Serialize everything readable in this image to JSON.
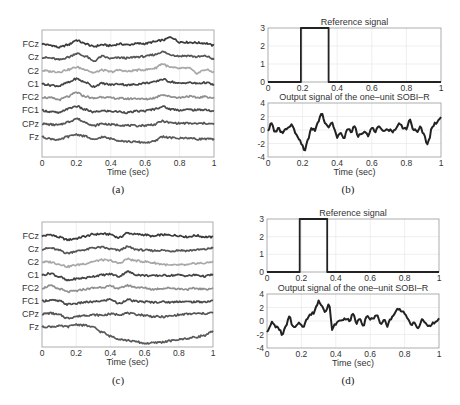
{
  "chart_data": [
    {
      "panel": "(a)",
      "type": "line",
      "title": "",
      "xlabel": "Time (sec)",
      "ylabel": "",
      "xlim": [
        0,
        1
      ],
      "xticks": [
        "0",
        "0.2",
        "0.4",
        "0.6",
        "0.8",
        "1"
      ],
      "grid": true,
      "channels": [
        "FCz",
        "Cz",
        "C2",
        "C1",
        "FC2",
        "FC1",
        "CPz",
        "Fz"
      ],
      "channel_colors": [
        "#3a3a3a",
        "#555555",
        "#a8a8a8",
        "#444444",
        "#909090",
        "#4a4a4a",
        "#555555",
        "#5a5a5a"
      ],
      "x": [
        0,
        0.05,
        0.1,
        0.15,
        0.2,
        0.25,
        0.3,
        0.35,
        0.4,
        0.45,
        0.5,
        0.55,
        0.6,
        0.65,
        0.7,
        0.75,
        0.8,
        0.85,
        0.9,
        0.95,
        1.0
      ],
      "series": [
        {
          "name": "FCz",
          "values": [
            0,
            -0.3,
            -0.8,
            -0.2,
            0.9,
            0.1,
            -0.6,
            -0.2,
            -0.4,
            0,
            -0.2,
            0.1,
            0.1,
            0.5,
            0.9,
            1.6,
            0.5,
            0.4,
            0.3,
            0.2,
            -0.4
          ]
        },
        {
          "name": "Cz",
          "values": [
            0,
            -0.2,
            -0.6,
            0,
            0.9,
            0.3,
            -0.9,
            0.2,
            -0.3,
            -0.1,
            -0.2,
            0.1,
            0.2,
            0.6,
            1.3,
            0.6,
            0.3,
            0.4,
            0.1,
            0.3,
            -0.4
          ]
        },
        {
          "name": "C2",
          "values": [
            0,
            -0.2,
            -0.3,
            0.2,
            0.8,
            0.3,
            -0.5,
            0.1,
            -0.3,
            0.1,
            -0.2,
            0.1,
            0.2,
            0.5,
            1.6,
            0.7,
            0.5,
            0.6,
            -0.6,
            0.2,
            -0.3
          ]
        },
        {
          "name": "C1",
          "values": [
            0,
            -0.3,
            -0.5,
            0.3,
            1.2,
            0.4,
            -0.6,
            0.1,
            -0.2,
            0,
            -0.3,
            -0.1,
            0.2,
            0.4,
            1.1,
            0.5,
            0.1,
            0.3,
            0.1,
            0.3,
            -0.2
          ]
        },
        {
          "name": "FC2",
          "values": [
            0,
            -0.2,
            -0.6,
            0.1,
            1.1,
            0.2,
            -0.3,
            0.1,
            -0.2,
            -0.3,
            -0.4,
            -0.3,
            -0.5,
            -0.2,
            0.6,
            0.1,
            -0.1,
            0.2,
            -0.1,
            0.1,
            -0.2
          ]
        },
        {
          "name": "FC1",
          "values": [
            0,
            -0.3,
            -0.6,
            0.4,
            1.0,
            0.2,
            -0.4,
            -0.1,
            -0.2,
            -0.3,
            -0.5,
            -0.2,
            -0.1,
            0.3,
            0.9,
            0.3,
            0.1,
            0.2,
            0.1,
            0.2,
            -0.3
          ]
        },
        {
          "name": "CPz",
          "values": [
            0,
            -0.2,
            -0.3,
            0.4,
            1.2,
            0.4,
            -0.5,
            0,
            -0.2,
            -0.3,
            -0.4,
            -0.5,
            -0.4,
            -0.2,
            0.6,
            0.2,
            0.1,
            0.1,
            0,
            0.1,
            -0.1
          ]
        },
        {
          "name": "Fz",
          "values": [
            0,
            -0.4,
            -0.7,
            0.1,
            0.6,
            0.2,
            -0.7,
            0,
            -0.4,
            -0.8,
            -1.1,
            -1.2,
            -1.3,
            -1.1,
            0.1,
            -0.2,
            -0.3,
            -0.2,
            -0.5,
            -0.4,
            -0.6
          ]
        }
      ]
    },
    {
      "panel": "(b)",
      "subplots": [
        {
          "type": "line",
          "title": "Reference signal",
          "xlim": [
            0,
            1
          ],
          "ylim": [
            0,
            3
          ],
          "xticks": [
            "0",
            "0.2",
            "0.4",
            "0.6",
            "0.8",
            "1"
          ],
          "yticks": [
            "0",
            "1",
            "2",
            "3"
          ],
          "grid": true,
          "x": [
            0,
            0.19,
            0.19,
            0.35,
            0.35,
            1
          ],
          "values": [
            0,
            0,
            3,
            3,
            0,
            0
          ]
        },
        {
          "type": "line",
          "title": "Output signal of the one–unit SOBI–R",
          "xlabel": "Time (sec)",
          "xlim": [
            0,
            1
          ],
          "ylim": [
            -4,
            4
          ],
          "xticks": [
            "0",
            "0.2",
            "0.4",
            "0.6",
            "0.8",
            "1"
          ],
          "yticks": [
            "-4",
            "-2",
            "0",
            "2",
            "4"
          ],
          "grid": true,
          "x": [
            0,
            0.02,
            0.04,
            0.06,
            0.08,
            0.1,
            0.12,
            0.14,
            0.16,
            0.18,
            0.2,
            0.21,
            0.23,
            0.25,
            0.27,
            0.29,
            0.31,
            0.33,
            0.35,
            0.37,
            0.4,
            0.42,
            0.44,
            0.46,
            0.48,
            0.5,
            0.52,
            0.54,
            0.56,
            0.58,
            0.6,
            0.62,
            0.64,
            0.66,
            0.68,
            0.7,
            0.72,
            0.74,
            0.76,
            0.78,
            0.8,
            0.82,
            0.84,
            0.86,
            0.88,
            0.9,
            0.92,
            0.93,
            0.95,
            0.97,
            1.0
          ],
          "values": [
            0,
            1.0,
            -0.3,
            0.2,
            -0.4,
            0,
            0.3,
            0.7,
            -0.4,
            -1.5,
            -2.2,
            -3.0,
            -1.5,
            0.2,
            0,
            1.2,
            2.6,
            1.2,
            0.4,
            1.0,
            -1.0,
            -0.5,
            -1.2,
            0.3,
            -0.3,
            0.5,
            -0.9,
            -0.5,
            -0.1,
            -0.8,
            0.3,
            -0.2,
            0.4,
            -0.1,
            0.1,
            0,
            -0.2,
            0.2,
            1.0,
            0.4,
            0.2,
            1.4,
            0.1,
            -0.2,
            0.4,
            -0.6,
            -2.2,
            -1.5,
            0.6,
            1.0,
            1.8
          ]
        }
      ]
    },
    {
      "panel": "(c)",
      "type": "line",
      "xlabel": "Time (sec)",
      "xlim": [
        0,
        1
      ],
      "xticks": [
        "0",
        "0.2",
        "0.4",
        "0.6",
        "0.8",
        "1"
      ],
      "grid": true,
      "channels": [
        "FCz",
        "Cz",
        "C2",
        "C1",
        "FC2",
        "FC1",
        "CPz",
        "Fz"
      ],
      "channel_colors": [
        "#3a3a3a",
        "#555555",
        "#a8a8a8",
        "#444444",
        "#909090",
        "#4a4a4a",
        "#555555",
        "#5a5a5a"
      ],
      "x": [
        0,
        0.05,
        0.1,
        0.15,
        0.2,
        0.25,
        0.3,
        0.35,
        0.4,
        0.45,
        0.5,
        0.55,
        0.6,
        0.65,
        0.7,
        0.75,
        0.8,
        0.85,
        0.9,
        0.95,
        1.0
      ],
      "series": [
        {
          "name": "FCz",
          "values": [
            0,
            0.3,
            -0.3,
            -0.9,
            -0.6,
            -0.1,
            0.4,
            0.5,
            0.4,
            -0.4,
            0.7,
            0.4,
            0.3,
            -0.1,
            0.3,
            0.2,
            0.1,
            -0.2,
            0.1,
            -0.2,
            -0.3
          ]
        },
        {
          "name": "Cz",
          "values": [
            0,
            0.2,
            -0.3,
            -1.0,
            -0.5,
            -0.2,
            0.3,
            0.4,
            0,
            -0.3,
            0.5,
            -0.1,
            -0.3,
            -0.4,
            -0.3,
            -0.5,
            -0.3,
            -0.4,
            -0.2,
            -0.1,
            0.3
          ]
        },
        {
          "name": "C2",
          "values": [
            0,
            0,
            -0.5,
            -1.1,
            -0.7,
            -0.4,
            0.1,
            0.5,
            0.3,
            -0.3,
            0.7,
            0.3,
            0.1,
            -0.2,
            -0.5,
            -0.8,
            -0.7,
            -0.7,
            -0.3,
            -0.3,
            0.1
          ]
        },
        {
          "name": "C1",
          "values": [
            0,
            0.4,
            -0.4,
            -1.3,
            -0.9,
            -0.7,
            -0.3,
            0,
            0.2,
            -0.3,
            0.8,
            0.1,
            -0.1,
            -0.2,
            -0.1,
            -0.1,
            0,
            -0.2,
            0,
            -0.3,
            0.1
          ]
        },
        {
          "name": "FC2",
          "values": [
            0,
            0.5,
            -0.2,
            -0.9,
            -0.7,
            -0.3,
            0,
            0.2,
            0.4,
            -0.1,
            0.6,
            0.2,
            0,
            -0.3,
            -0.1,
            0,
            -0.2,
            -0.3,
            -0.1,
            -0.3,
            -0.1
          ]
        },
        {
          "name": "FC1",
          "values": [
            0,
            0.2,
            0,
            -0.8,
            -0.6,
            -0.3,
            -0.2,
            0,
            0.4,
            -0.6,
            0.3,
            -0.1,
            -0.2,
            -0.3,
            -0.2,
            -0.3,
            -0.1,
            -0.2,
            -0.2,
            -0.2,
            0
          ]
        },
        {
          "name": "CPz",
          "values": [
            0,
            0.2,
            -0.2,
            -1.0,
            -0.6,
            -0.3,
            -0.2,
            -0.3,
            0,
            -0.1,
            0.2,
            -0.1,
            -0.3,
            -0.6,
            -0.7,
            -0.5,
            -0.2,
            0,
            0.1,
            0.1,
            0.3
          ]
        },
        {
          "name": "Fz",
          "values": [
            0,
            0.1,
            0.2,
            0.1,
            0.6,
            0.4,
            -0.1,
            -1.2,
            -2.2,
            -2.8,
            -3.2,
            -3.5,
            -3.9,
            -3.8,
            -3.6,
            -3.3,
            -3.0,
            -2.7,
            -2.4,
            -2.0,
            -1.1
          ]
        }
      ]
    },
    {
      "panel": "(d)",
      "subplots": [
        {
          "type": "line",
          "title": "Reference signal",
          "xlim": [
            0,
            1
          ],
          "ylim": [
            0,
            3
          ],
          "xticks": [
            "0",
            "0.2",
            "0.4",
            "0.6",
            "0.8",
            "1"
          ],
          "yticks": [
            "0",
            "1",
            "2",
            "3"
          ],
          "grid": true,
          "x": [
            0,
            0.19,
            0.19,
            0.35,
            0.35,
            1
          ],
          "values": [
            0,
            0,
            3,
            3,
            0,
            0
          ]
        },
        {
          "type": "line",
          "title": "Output signal of the one–unit SOBI–R",
          "xlabel": "Time (sec)",
          "xlim": [
            0,
            1
          ],
          "ylim": [
            -4,
            4
          ],
          "xticks": [
            "0",
            "0.2",
            "0.4",
            "0.6",
            "0.8",
            "1"
          ],
          "yticks": [
            "-4",
            "-2",
            "0",
            "2",
            "4"
          ],
          "grid": true,
          "x": [
            0,
            0.01,
            0.03,
            0.05,
            0.07,
            0.09,
            0.11,
            0.13,
            0.15,
            0.17,
            0.19,
            0.21,
            0.23,
            0.25,
            0.27,
            0.29,
            0.3,
            0.32,
            0.34,
            0.36,
            0.38,
            0.4,
            0.42,
            0.44,
            0.46,
            0.48,
            0.5,
            0.52,
            0.54,
            0.56,
            0.58,
            0.6,
            0.62,
            0.64,
            0.66,
            0.68,
            0.7,
            0.72,
            0.74,
            0.76,
            0.78,
            0.8,
            0.82,
            0.84,
            0.86,
            0.88,
            0.9,
            0.92,
            0.94,
            0.96,
            0.98,
            1.0
          ],
          "values": [
            -1.5,
            -1.2,
            -0.2,
            -0.8,
            -1.2,
            -2.0,
            -0.8,
            0.6,
            -0.8,
            -0.7,
            -0.3,
            -0.8,
            0.2,
            0.9,
            1.2,
            2.3,
            3.0,
            2.3,
            1.4,
            2.4,
            -1.2,
            -0.4,
            0,
            0.2,
            0.4,
            0,
            1.0,
            -0.3,
            0.4,
            -0.6,
            0.8,
            0.2,
            0.5,
            0.7,
            -0.5,
            0.3,
            -0.7,
            0.4,
            1.0,
            1.8,
            1.6,
            1.2,
            0.1,
            -0.5,
            -0.3,
            -1.2,
            0.2,
            -0.3,
            -0.8,
            -0.4,
            -0.2,
            0.3
          ]
        }
      ]
    }
  ],
  "captions": [
    "(a)",
    "(b)",
    "(c)",
    "(d)"
  ],
  "xlabel": "Time (sec)"
}
